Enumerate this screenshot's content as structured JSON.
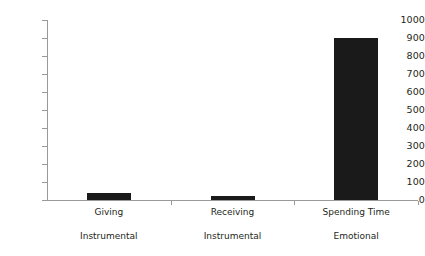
{
  "chart_data": {
    "type": "bar",
    "title": "",
    "subtitle": "",
    "xlabel": "",
    "ylabel": "",
    "categories": [
      "Giving",
      "Receiving",
      "Spending Time"
    ],
    "group_labels": [
      "Instrumental",
      "Instrumental",
      "Emotional"
    ],
    "values": [
      40,
      20,
      900
    ],
    "ylim": [
      0,
      1000
    ],
    "y_ticks": [
      0,
      100,
      200,
      300,
      400,
      500,
      600,
      700,
      800,
      900,
      1000
    ],
    "y_tick_labels": [
      "0",
      "100",
      "200",
      "300",
      "400",
      "500",
      "600",
      "700",
      "800",
      "900",
      "1000"
    ],
    "grid": false,
    "legend": false,
    "legend_position": "none",
    "bar_color": "#1a1a1a",
    "axis_color": "#9a9a9a",
    "background_color": "#ffffff",
    "series": [
      {
        "name": "",
        "values": [
          40,
          20,
          900
        ]
      }
    ]
  }
}
